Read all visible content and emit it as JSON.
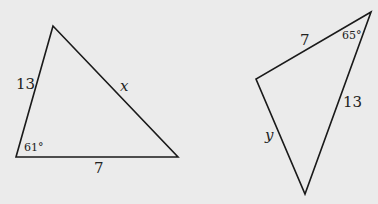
{
  "triangle_left": {
    "side_left": "13",
    "side_right": "x",
    "side_bottom": "7",
    "angle_bottom_left": "61°"
  },
  "triangle_right": {
    "side_top": "7",
    "side_right": "13",
    "side_left": "y",
    "angle_top_right": "65°"
  },
  "colors": {
    "background": "#ebebeb",
    "stroke": "#1a1a1a"
  }
}
